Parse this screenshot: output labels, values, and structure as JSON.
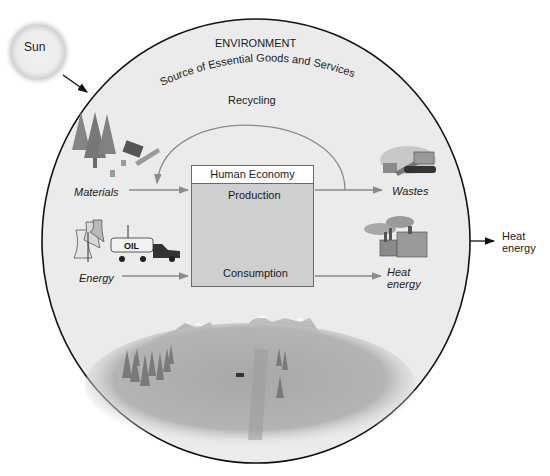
{
  "diagram": {
    "sun_label": "Sun",
    "environment": {
      "title": "ENVIRONMENT",
      "subtitle": "Source of Essential Goods and Services"
    },
    "recycling_label": "Recycling",
    "human_economy": {
      "title": "Human Economy",
      "production": "Production",
      "consumption": "Consumption"
    },
    "inputs": [
      {
        "label": "Materials",
        "icon": "forest-logging-icon"
      },
      {
        "label": "Energy",
        "icon": "power-plant-oil-truck-icon"
      }
    ],
    "outputs": [
      {
        "label": "Wastes",
        "icon": "landfill-bulldozer-icon"
      },
      {
        "label_line1": "Heat",
        "label_line2": "energy",
        "icon": "factory-icon"
      }
    ],
    "outside_output": {
      "line1": "Heat",
      "line2": "energy"
    },
    "scene": "landscape-mountains-icon",
    "colors": {
      "environment_fill": "#ebebeb",
      "outline": "#111111",
      "flow_arrow": "#8a8a8a",
      "economy_box": "#cfcfcf"
    }
  }
}
